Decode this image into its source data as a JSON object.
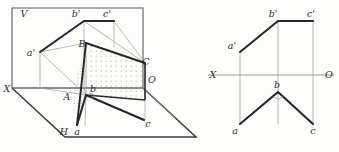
{
  "figure": {
    "type": "descriptive-geometry-projection",
    "background_color": "#fdfdfc",
    "stroke_color": "#2b2b2b",
    "thin_stroke_color": "#8d8d8d",
    "hatch_color": "#b9b5ad"
  },
  "pictorial": {
    "name": "pictorial-view",
    "plane_labels": {
      "vertical_plane": "V",
      "horizontal_plane": "H",
      "axis_left": "X",
      "axis_right": "O"
    },
    "points": [
      {
        "id": "a-prime",
        "label": "a'",
        "x": 31,
        "y": 53
      },
      {
        "id": "b-prime",
        "label": "b'",
        "x": 76,
        "y": 14
      },
      {
        "id": "c-prime",
        "label": "c'",
        "x": 107,
        "y": 14
      },
      {
        "id": "B",
        "label": "B",
        "x": 82,
        "y": 44
      },
      {
        "id": "C",
        "label": "C",
        "x": 146,
        "y": 62
      },
      {
        "id": "A",
        "label": "A",
        "x": 67,
        "y": 97
      },
      {
        "id": "b",
        "label": "b",
        "x": 93,
        "y": 89
      },
      {
        "id": "a",
        "label": "a",
        "x": 77,
        "y": 132
      },
      {
        "id": "c",
        "label": "c",
        "x": 148,
        "y": 124
      }
    ],
    "geometry": {
      "v_plane_frame": "12,8 143,8 143,88 12,88",
      "h_plane_frame": "12,88 65,137 196,137 143,88",
      "v_trace_points": "a'(40,52) b'(84,21) c'(114,21)",
      "h_trace_points": "a(85,126) b(86,95) c(144,120)",
      "space_figure": "A(77,97) B(86,43) C(145,63)",
      "shaded_quad": "86,43 145,63 145,100 86,95"
    }
  },
  "orthographic": {
    "name": "orthographic-view",
    "axis": {
      "label_left": "X",
      "label_right": "O",
      "y": 75,
      "x_start": 208,
      "x_end": 334
    },
    "points": [
      {
        "id": "a-prime",
        "label": "a'",
        "x": 232,
        "y": 46,
        "px": 240,
        "py": 52
      },
      {
        "id": "b-prime",
        "label": "b'",
        "x": 273,
        "y": 14,
        "px": 278,
        "py": 21
      },
      {
        "id": "c-prime",
        "label": "c'",
        "x": 311,
        "y": 14,
        "px": 313,
        "py": 21
      },
      {
        "id": "b",
        "label": "b",
        "x": 277,
        "y": 85,
        "px": 278,
        "py": 92
      },
      {
        "id": "a",
        "label": "a",
        "x": 235,
        "y": 131,
        "px": 240,
        "py": 124
      },
      {
        "id": "c",
        "label": "c",
        "x": 313,
        "y": 131,
        "px": 313,
        "py": 124
      }
    ],
    "geometry": {
      "front_view_polyline": "240,52 278,21 313,21",
      "top_view_polyline": "240,124 278,92 313,124",
      "projector_a": "240,52 240,124",
      "projector_b": "278,21 278,124",
      "projector_c": "313,21 313,124",
      "right_angle_marker": {
        "x": 278,
        "y": 92,
        "size": 7
      }
    }
  }
}
